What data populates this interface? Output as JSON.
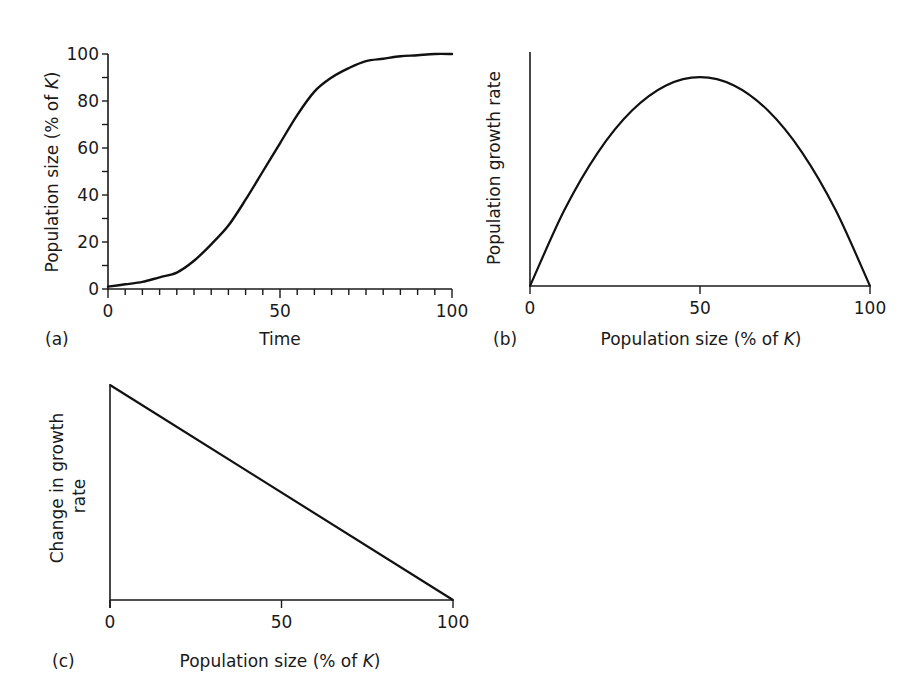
{
  "chart_data": [
    {
      "panel": "(a)",
      "type": "line",
      "title": "",
      "xlabel": "Time",
      "ylabel": "Population size (% of K)",
      "xlim": [
        0,
        100
      ],
      "ylim": [
        0,
        100
      ],
      "x_ticks": [
        0,
        50,
        100
      ],
      "x_tick_labels": [
        "0",
        "50",
        "100"
      ],
      "x_minor_tick_step": 5,
      "y_ticks": [
        0,
        20,
        40,
        60,
        80,
        100
      ],
      "y_tick_labels": [
        "0",
        "20",
        "40",
        "60",
        "80",
        "100"
      ],
      "y_minor_tick_step": 10,
      "grid": false,
      "series": [
        {
          "name": "logistic growth",
          "x": [
            0,
            5,
            10,
            15,
            20,
            25,
            30,
            35,
            40,
            45,
            50,
            55,
            60,
            65,
            70,
            75,
            80,
            85,
            90,
            95,
            100
          ],
          "values": [
            1,
            2,
            3,
            5,
            7,
            12,
            19,
            27,
            38,
            50,
            62,
            74,
            84,
            90,
            94,
            97,
            98,
            99,
            99.5,
            100,
            100
          ]
        }
      ]
    },
    {
      "panel": "(b)",
      "type": "line",
      "title": "",
      "xlabel": "Population size (% of K)",
      "ylabel": "Population growth rate",
      "xlim": [
        0,
        100
      ],
      "ylim": [
        0,
        1.12
      ],
      "x_ticks": [
        0,
        50,
        100
      ],
      "x_tick_labels": [
        "0",
        "50",
        "100"
      ],
      "y_ticks": [],
      "grid": false,
      "series": [
        {
          "name": "growth rate (parabola)",
          "x": [
            0,
            10,
            20,
            30,
            40,
            50,
            60,
            70,
            80,
            90,
            100
          ],
          "values": [
            0,
            0.36,
            0.64,
            0.84,
            0.96,
            1.0,
            0.96,
            0.84,
            0.64,
            0.36,
            0
          ]
        }
      ]
    },
    {
      "panel": "(c)",
      "type": "line",
      "title": "",
      "xlabel": "Population size (% of K)",
      "ylabel": "Change in growth rate",
      "xlim": [
        0,
        100
      ],
      "ylim": [
        0,
        1
      ],
      "x_ticks": [
        0,
        50,
        100
      ],
      "x_tick_labels": [
        "0",
        "50",
        "100"
      ],
      "y_ticks": [],
      "grid": false,
      "series": [
        {
          "name": "linear decline",
          "x": [
            0,
            100
          ],
          "values": [
            1,
            0
          ]
        }
      ]
    }
  ],
  "panels": {
    "a": {
      "label": "(a)",
      "xlabel": "Time",
      "ylabel_pre": "Population size (% of ",
      "ylabel_k": "K",
      "ylabel_post": ")"
    },
    "b": {
      "label": "(b)",
      "xlabel_pre": "Population size (% of ",
      "xlabel_k": "K",
      "xlabel_post": ")",
      "ylabel": "Population growth rate"
    },
    "c": {
      "label": "(c)",
      "xlabel_pre": "Population size (% of ",
      "xlabel_k": "K",
      "xlabel_post": ")",
      "ylabel_line1": "Change in growth",
      "ylabel_line2": "rate"
    }
  },
  "colors": {
    "line": "#111111",
    "axis": "#1a1a1a",
    "background": "#ffffff"
  }
}
